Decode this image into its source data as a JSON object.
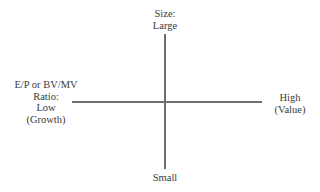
{
  "diagram": {
    "type": "quadrant-axes",
    "axes": {
      "vertical": {
        "name": "Size",
        "top_label": [
          "Size:",
          "Large"
        ],
        "bottom_label": [
          "Small"
        ]
      },
      "horizontal": {
        "name": "E/P or BV/MV Ratio",
        "left_label": [
          "E/P or BV/MV",
          "Ratio:",
          "Low",
          "(Growth)"
        ],
        "right_label": [
          "High",
          "(Value)"
        ]
      }
    },
    "colors": {
      "axis": "#6e6e6e",
      "text": "#3a3a3a",
      "background": "#ffffff"
    }
  }
}
